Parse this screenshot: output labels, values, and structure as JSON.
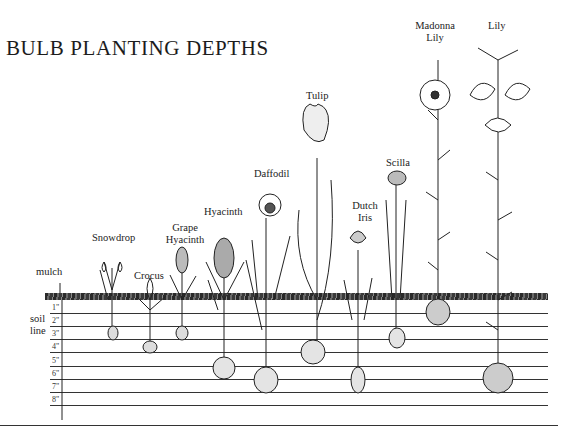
{
  "title": "BULB PLANTING DEPTHS",
  "side_labels": {
    "mulch": "mulch",
    "soil_line": [
      "soil",
      "line"
    ]
  },
  "depth_marks": [
    "1\"",
    "2\"",
    "3\"",
    "4\"",
    "5\"",
    "6\"",
    "7\"",
    "8\""
  ],
  "plants": [
    {
      "name": "Snowdrop",
      "label_lines": [
        "Snowdrop"
      ],
      "depth_in": 3
    },
    {
      "name": "Crocus",
      "label_lines": [
        "Crocus"
      ],
      "depth_in": 4
    },
    {
      "name": "Grape Hyacinth",
      "label_lines": [
        "Grape",
        "Hyacinth"
      ],
      "depth_in": 3
    },
    {
      "name": "Hyacinth",
      "label_lines": [
        "Hyacinth"
      ],
      "depth_in": 6
    },
    {
      "name": "Daffodil",
      "label_lines": [
        "Daffodil"
      ],
      "depth_in": 7
    },
    {
      "name": "Tulip",
      "label_lines": [
        "Tulip"
      ],
      "depth_in": 6
    },
    {
      "name": "Dutch Iris",
      "label_lines": [
        "Dutch",
        "Iris"
      ],
      "depth_in": 7
    },
    {
      "name": "Scilla",
      "label_lines": [
        "Scilla"
      ],
      "depth_in": 4
    },
    {
      "name": "Madonna Lily",
      "label_lines": [
        "Madonna",
        "Lily"
      ],
      "depth_in": 2
    },
    {
      "name": "Lily",
      "label_lines": [
        "Lily"
      ],
      "depth_in": 8
    }
  ]
}
